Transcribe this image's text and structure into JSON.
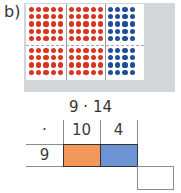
{
  "label": "b)",
  "dot_array": {
    "rows_top": 5,
    "rows_bottom": 4,
    "red_blocks": 2,
    "red_columns_per_block": 5,
    "blue_columns": 4,
    "colors": {
      "red": "#d9361f",
      "blue": "#1f4f99",
      "background": "#d3d6d8"
    }
  },
  "expression": "9 · 14",
  "table": {
    "operator": "·",
    "headers": [
      "10",
      "4"
    ],
    "row_label": "9",
    "cell_colors": [
      "#f4975a",
      "#6e92d4"
    ],
    "result_box": ""
  }
}
